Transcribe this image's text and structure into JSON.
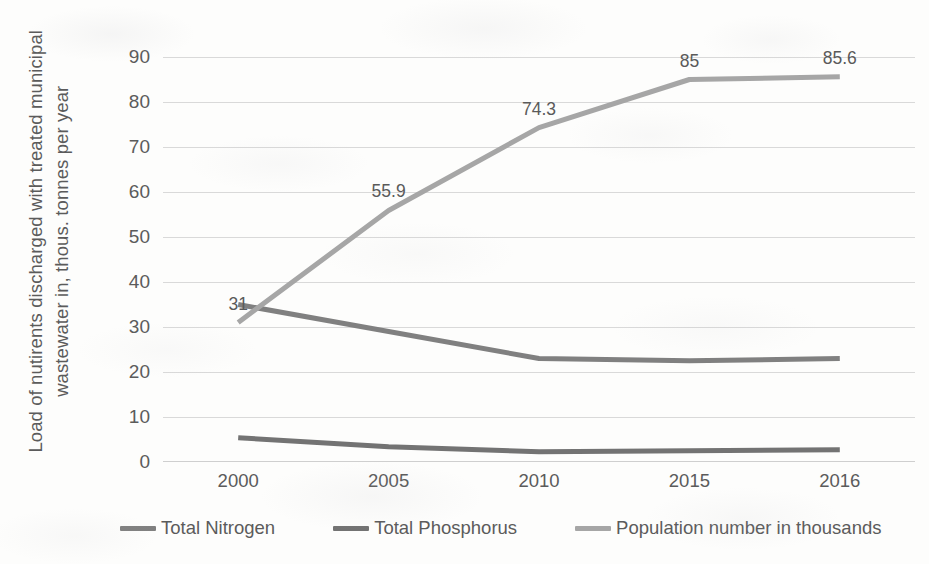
{
  "chart_data": {
    "type": "line",
    "title": "",
    "xlabel": "",
    "ylabel": "Load of nutirents discharged with treated municipal wastewater in, thous. tonnes per year",
    "categories": [
      "2000",
      "2005",
      "2010",
      "2015",
      "2016"
    ],
    "ylim": [
      0,
      90
    ],
    "yticks": [
      0,
      10,
      20,
      30,
      40,
      50,
      60,
      70,
      80,
      90
    ],
    "grid": true,
    "legend_position": "bottom",
    "series": [
      {
        "name": "Total Nitrogen",
        "color": "#808080",
        "values": [
          35,
          29,
          23,
          22.5,
          23
        ],
        "labels": []
      },
      {
        "name": "Total Phosphorus",
        "color": "#737373",
        "values": [
          5.4,
          3.4,
          2.3,
          2.5,
          2.7
        ],
        "labels": []
      },
      {
        "name": "Population number in thousands",
        "color": "#a6a6a6",
        "values": [
          31,
          55.9,
          74.3,
          85,
          85.6
        ],
        "labels": [
          "31",
          "55.9",
          "74.3",
          "85",
          "85.6"
        ]
      }
    ]
  },
  "axes": {
    "y_title": "Load of nutirents discharged with treated municipal wastewater in, thous. tonnes per year",
    "y_tick_labels": [
      "90",
      "80",
      "70",
      "60",
      "50",
      "40",
      "30",
      "20",
      "10",
      "0"
    ],
    "x_tick_labels": [
      "2000",
      "2005",
      "2010",
      "2015",
      "2016"
    ]
  },
  "legend": {
    "items": [
      {
        "label": "Total Nitrogen",
        "color": "#808080"
      },
      {
        "label": "Total Phosphorus",
        "color": "#737373"
      },
      {
        "label": "Population number in thousands",
        "color": "#a6a6a6"
      }
    ]
  },
  "data_labels": {
    "population": [
      "31",
      "55.9",
      "74.3",
      "85",
      "85.6"
    ]
  },
  "colors": {
    "gridline": "#d9d9d9",
    "text": "#5b5b5b",
    "background": "#fdfdfc"
  }
}
